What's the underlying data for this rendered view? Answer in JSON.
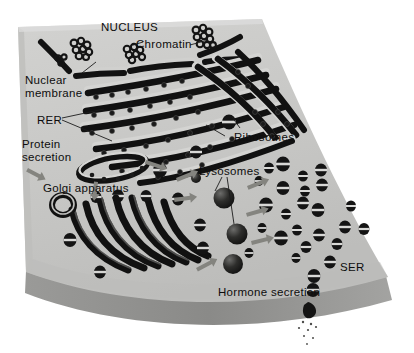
{
  "figure": {
    "kind": "cell-organelle-diagram",
    "background_color": "#ffffff",
    "cytoplasm_color": "#c9c9c7",
    "cytoplasm_shade_color": "#b4b4b2",
    "membrane_edge_color": "#8f8f8f",
    "organelle_color": "#151515",
    "highlight_color": "#e4e4e2",
    "arrow_color": "#7e7e7c"
  },
  "labels": [
    {
      "id": "nucleus",
      "text": "NUCLEUS",
      "x": 101,
      "y": 21,
      "size": 11.5,
      "caps": true
    },
    {
      "id": "chromatin",
      "text": "Chromatin",
      "x": 136,
      "y": 38,
      "size": 11.5,
      "caps": false
    },
    {
      "id": "nuclear-membrane-1",
      "text": "Nuclear",
      "x": 25,
      "y": 74,
      "size": 11.5,
      "caps": false
    },
    {
      "id": "nuclear-membrane-2",
      "text": "membrane",
      "x": 25,
      "y": 87,
      "size": 11.5,
      "caps": false
    },
    {
      "id": "rer",
      "text": "RER",
      "x": 37,
      "y": 114,
      "size": 11.5,
      "caps": true
    },
    {
      "id": "protein-secretion-1",
      "text": "Protein",
      "x": 22,
      "y": 138,
      "size": 11.5,
      "caps": false
    },
    {
      "id": "protein-secretion-2",
      "text": "secretion",
      "x": 22,
      "y": 151,
      "size": 11.5,
      "caps": false
    },
    {
      "id": "golgi-apparatus",
      "text": "Golgi apparatus",
      "x": 43,
      "y": 182,
      "size": 11.5,
      "caps": false
    },
    {
      "id": "ribosomes",
      "text": "Ribosomes",
      "x": 234,
      "y": 131,
      "size": 11.5,
      "caps": false
    },
    {
      "id": "lysosomes",
      "text": "Lysosomes",
      "x": 199,
      "y": 165,
      "size": 11.5,
      "caps": false
    },
    {
      "id": "ser",
      "text": "SER",
      "x": 340,
      "y": 261,
      "size": 11.5,
      "caps": true
    },
    {
      "id": "hormone-secretion",
      "text": "Hormone secretion",
      "x": 218,
      "y": 286,
      "size": 11.5,
      "caps": false
    }
  ],
  "organelles": {
    "nuclear_membrane_segments": 3,
    "chromatin_clumps": 4,
    "rer_cisternae": 9,
    "golgi_cisternae": 7,
    "lysosome_spheres": 4,
    "ser_tubule_count": 26,
    "free_ribosome_vesicles": 5,
    "secretion_vesicles": 3
  }
}
